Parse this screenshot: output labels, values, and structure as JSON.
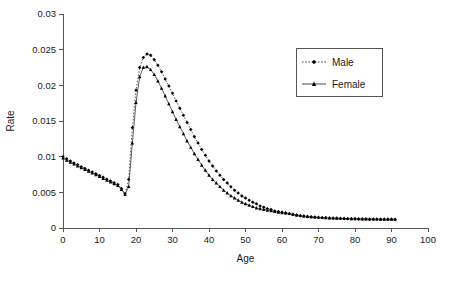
{
  "chart_data": {
    "type": "line",
    "title": "",
    "subtitle": "",
    "xlabel": "Age",
    "ylabel": "Rate",
    "xlim": [
      0,
      100
    ],
    "ylim": [
      0,
      0.03
    ],
    "grid": false,
    "legend_position": "top-right",
    "x_ticks": [
      0,
      10,
      20,
      30,
      40,
      50,
      60,
      70,
      80,
      90,
      100
    ],
    "x_tick_labels": [
      "0",
      "10",
      "20",
      "30",
      "40",
      "50",
      "60",
      "70",
      "80",
      "90",
      "100"
    ],
    "y_ticks": [
      0,
      0.005,
      0.01,
      0.015,
      0.02,
      0.025,
      0.03
    ],
    "y_tick_labels": [
      "0",
      "0.005",
      "0.01",
      "0.015",
      "0.02",
      "0.025",
      "0.03"
    ],
    "x": [
      0,
      1,
      2,
      3,
      4,
      5,
      6,
      7,
      8,
      9,
      10,
      11,
      12,
      13,
      14,
      15,
      16,
      17,
      18,
      19,
      20,
      21,
      22,
      23,
      24,
      25,
      26,
      27,
      28,
      29,
      30,
      31,
      32,
      33,
      34,
      35,
      36,
      37,
      38,
      39,
      40,
      41,
      42,
      43,
      44,
      45,
      46,
      47,
      48,
      49,
      50,
      51,
      52,
      53,
      54,
      55,
      56,
      57,
      58,
      59,
      60,
      61,
      62,
      63,
      64,
      65,
      66,
      67,
      68,
      69,
      70,
      71,
      72,
      73,
      74,
      75,
      76,
      77,
      78,
      79,
      80,
      81,
      82,
      83,
      84,
      85,
      86,
      87,
      88,
      89,
      90,
      91
    ],
    "series": [
      {
        "name": "Male",
        "marker": "diamond",
        "line_style": "dotted",
        "color": "#000000",
        "values": [
          0.01,
          0.0097,
          0.0094,
          0.0091,
          0.00885,
          0.0086,
          0.00835,
          0.0081,
          0.00785,
          0.0076,
          0.00735,
          0.0071,
          0.00685,
          0.0066,
          0.00635,
          0.0061,
          0.00555,
          0.0048,
          0.0068,
          0.0141,
          0.0193,
          0.0225,
          0.0239,
          0.0244,
          0.0242,
          0.0236,
          0.0228,
          0.0219,
          0.0209,
          0.0199,
          0.0189,
          0.0178,
          0.0168,
          0.0158,
          0.0148,
          0.0138,
          0.0128,
          0.0119,
          0.011,
          0.0102,
          0.0094,
          0.0087,
          0.008,
          0.0074,
          0.0068,
          0.0063,
          0.0058,
          0.0053,
          0.0049,
          0.0045,
          0.0042,
          0.0039,
          0.0036,
          0.0034,
          0.0031,
          0.0029,
          0.0027,
          0.0026,
          0.0024,
          0.0023,
          0.0022,
          0.0021,
          0.002,
          0.0019,
          0.0018,
          0.0017,
          0.00165,
          0.0016,
          0.00155,
          0.0015,
          0.00148,
          0.00145,
          0.00142,
          0.0014,
          0.00138,
          0.00136,
          0.00134,
          0.00132,
          0.0013,
          0.00129,
          0.00128,
          0.00127,
          0.00126,
          0.00125,
          0.00124,
          0.00123,
          0.00123,
          0.00122,
          0.00122,
          0.00121,
          0.00121,
          0.0012
        ]
      },
      {
        "name": "Female",
        "marker": "triangle",
        "line_style": "solid",
        "color": "#000000",
        "values": [
          0.0098,
          0.0095,
          0.0092,
          0.00895,
          0.0087,
          0.00845,
          0.0082,
          0.00795,
          0.0077,
          0.00745,
          0.0072,
          0.00695,
          0.0067,
          0.00645,
          0.0062,
          0.00595,
          0.0054,
          0.0047,
          0.0058,
          0.0119,
          0.0176,
          0.0212,
          0.0225,
          0.0226,
          0.0222,
          0.0215,
          0.0206,
          0.0196,
          0.0185,
          0.0174,
          0.0163,
          0.0152,
          0.0142,
          0.0132,
          0.0122,
          0.0113,
          0.0104,
          0.0096,
          0.0088,
          0.0081,
          0.0074,
          0.0068,
          0.0063,
          0.0058,
          0.0053,
          0.0049,
          0.0045,
          0.0042,
          0.0039,
          0.0036,
          0.0034,
          0.0032,
          0.003,
          0.0028,
          0.0027,
          0.0026,
          0.0025,
          0.0024,
          0.0023,
          0.0022,
          0.00215,
          0.0021,
          0.00202,
          0.00192,
          0.00183,
          0.00174,
          0.00168,
          0.00162,
          0.00157,
          0.00152,
          0.00149,
          0.00146,
          0.00143,
          0.00141,
          0.00139,
          0.00137,
          0.00135,
          0.00133,
          0.00131,
          0.0013,
          0.00129,
          0.00128,
          0.00127,
          0.00126,
          0.00125,
          0.00124,
          0.00124,
          0.00123,
          0.00123,
          0.00122,
          0.00122,
          0.00121
        ]
      }
    ],
    "legend_entries": [
      {
        "label": "Male",
        "marker": "diamond",
        "line_style": "dotted"
      },
      {
        "label": "Female",
        "marker": "triangle",
        "line_style": "solid"
      }
    ]
  }
}
